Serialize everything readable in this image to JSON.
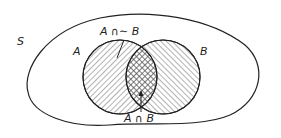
{
  "diagram": {
    "type": "venn",
    "universe_label": "S",
    "set_a_label": "A",
    "set_b_label": "B",
    "a_minus_b_label": "A ∩∼ B",
    "a_and_b_label": "A ∩ B",
    "colors": {
      "stroke": "#222222",
      "hatch": "#555555",
      "background": "#ffffff"
    }
  }
}
